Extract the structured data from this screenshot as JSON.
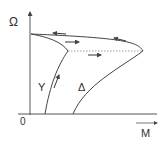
{
  "axes": {
    "y_label": "Ω",
    "x_label": "M",
    "origin_label": "0"
  },
  "curves": {
    "star_label": "Y",
    "delta_label": "Δ"
  },
  "colors": {
    "line": "#444444",
    "text": "#333333",
    "dashed": "#888888"
  }
}
